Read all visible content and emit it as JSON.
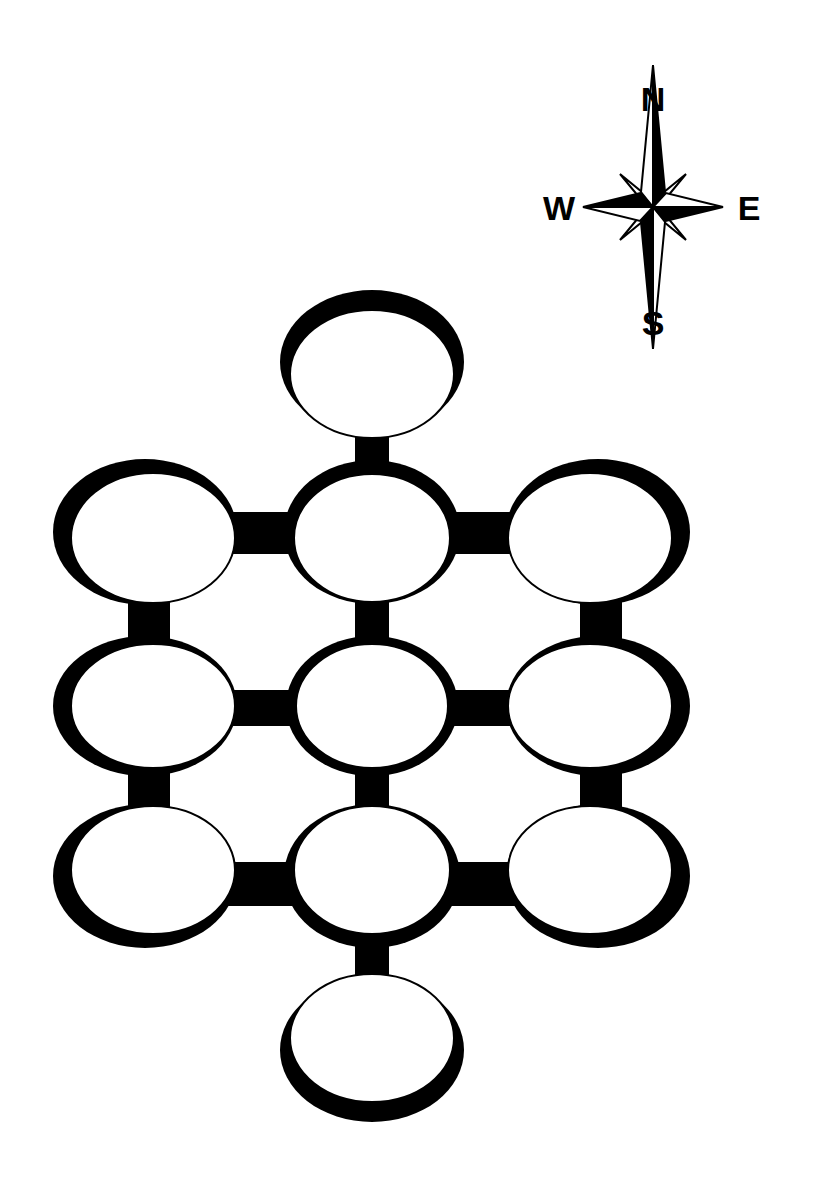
{
  "compass": {
    "north_label": "N",
    "south_label": "S",
    "east_label": "E",
    "west_label": "W"
  },
  "colors": {
    "ink": "#000000",
    "paper": "#ffffff"
  },
  "rooms": [
    {
      "id": "room-top",
      "cx": 372,
      "cy": 362,
      "rx": 92,
      "ry": 72,
      "dx": 0,
      "dy": 12
    },
    {
      "id": "room-r1-left",
      "cx": 145,
      "cy": 532,
      "rx": 92,
      "ry": 73,
      "dx": 8,
      "dy": 6
    },
    {
      "id": "room-r1-center",
      "cx": 372,
      "cy": 532,
      "rx": 88,
      "ry": 72,
      "dx": 0,
      "dy": 6
    },
    {
      "id": "room-r1-right",
      "cx": 598,
      "cy": 532,
      "rx": 92,
      "ry": 73,
      "dx": -8,
      "dy": 6
    },
    {
      "id": "room-r2-left",
      "cx": 145,
      "cy": 706,
      "rx": 92,
      "ry": 70,
      "dx": 8,
      "dy": 0
    },
    {
      "id": "room-r2-center",
      "cx": 372,
      "cy": 706,
      "rx": 86,
      "ry": 70,
      "dx": 0,
      "dy": 0
    },
    {
      "id": "room-r2-right",
      "cx": 598,
      "cy": 706,
      "rx": 92,
      "ry": 70,
      "dx": -8,
      "dy": 0
    },
    {
      "id": "room-r3-left",
      "cx": 145,
      "cy": 876,
      "rx": 92,
      "ry": 72,
      "dx": 8,
      "dy": -6
    },
    {
      "id": "room-r3-center",
      "cx": 372,
      "cy": 876,
      "rx": 88,
      "ry": 72,
      "dx": 0,
      "dy": -6
    },
    {
      "id": "room-r3-right",
      "cx": 598,
      "cy": 876,
      "rx": 92,
      "ry": 72,
      "dx": -8,
      "dy": -6
    },
    {
      "id": "room-bottom",
      "cx": 372,
      "cy": 1050,
      "rx": 92,
      "ry": 72,
      "dx": 0,
      "dy": -12
    }
  ],
  "corridors": [
    {
      "id": "corridor-top-r1c",
      "x": 355,
      "y": 430,
      "w": 34,
      "h": 40
    },
    {
      "id": "corridor-r1l-r1c",
      "x": 228,
      "y": 512,
      "w": 70,
      "h": 42
    },
    {
      "id": "corridor-r1c-r1r",
      "x": 446,
      "y": 512,
      "w": 70,
      "h": 42
    },
    {
      "id": "corridor-r1l-r2l",
      "x": 128,
      "y": 595,
      "w": 42,
      "h": 50
    },
    {
      "id": "corridor-r1c-r2c",
      "x": 355,
      "y": 595,
      "w": 34,
      "h": 50
    },
    {
      "id": "corridor-r1r-r2r",
      "x": 580,
      "y": 595,
      "w": 42,
      "h": 50
    },
    {
      "id": "corridor-r2l-r2c",
      "x": 228,
      "y": 690,
      "w": 70,
      "h": 36
    },
    {
      "id": "corridor-r2c-r2r",
      "x": 446,
      "y": 690,
      "w": 70,
      "h": 36
    },
    {
      "id": "corridor-r2l-r3l",
      "x": 128,
      "y": 768,
      "w": 42,
      "h": 50
    },
    {
      "id": "corridor-r2c-r3c",
      "x": 355,
      "y": 768,
      "w": 34,
      "h": 50
    },
    {
      "id": "corridor-r2r-r3r",
      "x": 580,
      "y": 768,
      "w": 42,
      "h": 50
    },
    {
      "id": "corridor-r3l-r3c",
      "x": 228,
      "y": 862,
      "w": 70,
      "h": 44
    },
    {
      "id": "corridor-r3c-r3r",
      "x": 446,
      "y": 862,
      "w": 70,
      "h": 44
    },
    {
      "id": "corridor-r3c-bottom",
      "x": 355,
      "y": 942,
      "w": 34,
      "h": 42
    }
  ]
}
